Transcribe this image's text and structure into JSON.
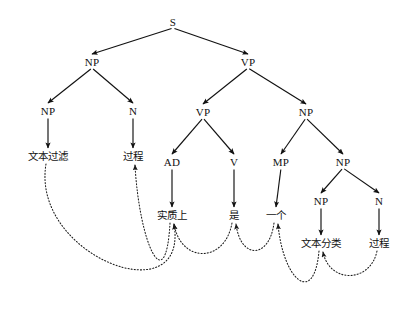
{
  "figure": {
    "type": "syntax-parse-tree-with-alignment",
    "background_color": "#ffffff",
    "stroke_color": "#111111",
    "arc_color": "#1a1a1a",
    "width": 408,
    "height": 309
  },
  "nodes": [
    {
      "id": "S",
      "label": "S",
      "kind": "nonterminal",
      "x": 173,
      "y": 22
    },
    {
      "id": "NP1",
      "label": "NP",
      "kind": "nonterminal",
      "x": 92,
      "y": 62
    },
    {
      "id": "VP1",
      "label": "VP",
      "kind": "nonterminal",
      "x": 248,
      "y": 62
    },
    {
      "id": "NP2",
      "label": "NP",
      "kind": "nonterminal",
      "x": 48,
      "y": 111
    },
    {
      "id": "N1",
      "label": "N",
      "kind": "nonterminal",
      "x": 133,
      "y": 111
    },
    {
      "id": "VP2",
      "label": "VP",
      "kind": "nonterminal",
      "x": 203,
      "y": 112
    },
    {
      "id": "NP3",
      "label": "NP",
      "kind": "nonterminal",
      "x": 306,
      "y": 112
    },
    {
      "id": "AD",
      "label": "AD",
      "kind": "nonterminal",
      "x": 172,
      "y": 162
    },
    {
      "id": "V",
      "label": "V",
      "kind": "nonterminal",
      "x": 234,
      "y": 162
    },
    {
      "id": "MP",
      "label": "MP",
      "kind": "nonterminal",
      "x": 281,
      "y": 162
    },
    {
      "id": "NP4",
      "label": "NP",
      "kind": "nonterminal",
      "x": 343,
      "y": 162
    },
    {
      "id": "NP5",
      "label": "NP",
      "kind": "nonterminal",
      "x": 321,
      "y": 201
    },
    {
      "id": "N2",
      "label": "N",
      "kind": "nonterminal",
      "x": 379,
      "y": 201
    },
    {
      "id": "L1",
      "label": "文本过滤",
      "kind": "leaf",
      "x": 48,
      "y": 156
    },
    {
      "id": "L2",
      "label": "过程",
      "kind": "leaf",
      "x": 133,
      "y": 156
    },
    {
      "id": "L3",
      "label": "实质上",
      "kind": "leaf",
      "x": 172,
      "y": 215
    },
    {
      "id": "L4",
      "label": "是",
      "kind": "leaf",
      "x": 234,
      "y": 215
    },
    {
      "id": "L5",
      "label": "一个",
      "kind": "leaf",
      "x": 276,
      "y": 215
    },
    {
      "id": "L6",
      "label": "文本分类",
      "kind": "leaf",
      "x": 321,
      "y": 243
    },
    {
      "id": "L7",
      "label": "过程",
      "kind": "leaf",
      "x": 379,
      "y": 243
    }
  ],
  "edges": [
    {
      "from": "S",
      "to": "NP1",
      "style": "solid"
    },
    {
      "from": "S",
      "to": "VP1",
      "style": "solid"
    },
    {
      "from": "NP1",
      "to": "NP2",
      "style": "solid"
    },
    {
      "from": "NP1",
      "to": "N1",
      "style": "solid"
    },
    {
      "from": "VP1",
      "to": "VP2",
      "style": "solid"
    },
    {
      "from": "VP1",
      "to": "NP3",
      "style": "solid"
    },
    {
      "from": "NP2",
      "to": "L1",
      "style": "solid"
    },
    {
      "from": "N1",
      "to": "L2",
      "style": "solid"
    },
    {
      "from": "VP2",
      "to": "AD",
      "style": "solid"
    },
    {
      "from": "VP2",
      "to": "V",
      "style": "solid"
    },
    {
      "from": "NP3",
      "to": "MP",
      "style": "solid"
    },
    {
      "from": "NP3",
      "to": "NP4",
      "style": "solid"
    },
    {
      "from": "AD",
      "to": "L3",
      "style": "solid"
    },
    {
      "from": "V",
      "to": "L4",
      "style": "solid"
    },
    {
      "from": "MP",
      "to": "L5",
      "style": "solid"
    },
    {
      "from": "NP4",
      "to": "NP5",
      "style": "solid"
    },
    {
      "from": "NP4",
      "to": "N2",
      "style": "solid"
    },
    {
      "from": "NP5",
      "to": "L6",
      "style": "solid"
    },
    {
      "from": "N2",
      "to": "L7",
      "style": "solid"
    }
  ],
  "alignment_arcs": [
    {
      "from": "L1",
      "to": "L3",
      "style": "dotted",
      "depth": 92
    },
    {
      "from": "L3",
      "to": "L2",
      "style": "dotted",
      "depth": 78
    },
    {
      "from": "L4",
      "to": "L3",
      "style": "dotted",
      "depth": 40
    },
    {
      "from": "L5",
      "to": "L4",
      "style": "dotted",
      "depth": 36
    },
    {
      "from": "L6",
      "to": "L5",
      "style": "dotted",
      "depth": 56
    },
    {
      "from": "L7",
      "to": "L6",
      "style": "dotted",
      "depth": 32
    }
  ]
}
